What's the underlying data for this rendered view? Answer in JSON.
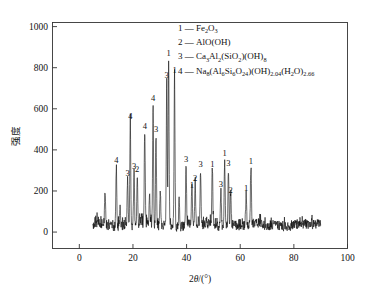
{
  "chart_data": {
    "type": "line",
    "title": "",
    "xlabel": "2θ/(°)",
    "ylabel": "强度",
    "xlim": [
      -10,
      100
    ],
    "ylim": [
      -80,
      1020
    ],
    "xticks": [
      0,
      20,
      40,
      60,
      80,
      100
    ],
    "yticks": [
      0,
      200,
      400,
      600,
      800,
      1000
    ],
    "xtick_labels": [
      "0",
      "20",
      "40",
      "60",
      "80",
      "100"
    ],
    "ytick_labels": [
      "0",
      "200",
      "400",
      "600",
      "800",
      "1000"
    ],
    "grid": false,
    "legend_position": "top-right",
    "series_name": "XRD pattern",
    "x_range_data": [
      5,
      90
    ],
    "baseline": 30,
    "peaks": [
      {
        "two_theta": 9.6,
        "intensity": 205,
        "label": ""
      },
      {
        "two_theta": 13.8,
        "intensity": 320,
        "label": "4"
      },
      {
        "two_theta": 15.2,
        "intensity": 130,
        "label": ""
      },
      {
        "two_theta": 18.0,
        "intensity": 255,
        "label": "3"
      },
      {
        "two_theta": 19.0,
        "intensity": 535,
        "label": "4"
      },
      {
        "two_theta": 20.4,
        "intensity": 290,
        "label": "3"
      },
      {
        "two_theta": 21.6,
        "intensity": 275,
        "label": "2"
      },
      {
        "two_theta": 24.4,
        "intensity": 487,
        "label": "4"
      },
      {
        "two_theta": 26.2,
        "intensity": 180,
        "label": ""
      },
      {
        "two_theta": 27.5,
        "intensity": 620,
        "label": "4"
      },
      {
        "two_theta": 28.6,
        "intensity": 470,
        "label": "3"
      },
      {
        "two_theta": 30.2,
        "intensity": 200,
        "label": ""
      },
      {
        "two_theta": 32.6,
        "intensity": 735,
        "label": "3"
      },
      {
        "two_theta": 33.3,
        "intensity": 840,
        "label": "1"
      },
      {
        "two_theta": 35.5,
        "intensity": 760,
        "label": "1"
      },
      {
        "two_theta": 37.2,
        "intensity": 180,
        "label": ""
      },
      {
        "two_theta": 39.8,
        "intensity": 325,
        "label": "3"
      },
      {
        "two_theta": 42.0,
        "intensity": 200,
        "label": "1"
      },
      {
        "two_theta": 43.2,
        "intensity": 235,
        "label": "2"
      },
      {
        "two_theta": 45.2,
        "intensity": 300,
        "label": "3"
      },
      {
        "two_theta": 49.6,
        "intensity": 300,
        "label": "1"
      },
      {
        "two_theta": 52.8,
        "intensity": 205,
        "label": "3"
      },
      {
        "two_theta": 54.2,
        "intensity": 355,
        "label": "1"
      },
      {
        "two_theta": 55.6,
        "intensity": 305,
        "label": "3"
      },
      {
        "two_theta": 56.4,
        "intensity": 175,
        "label": "2"
      },
      {
        "two_theta": 62.2,
        "intensity": 185,
        "label": "1"
      },
      {
        "two_theta": 64.0,
        "intensity": 315,
        "label": "1"
      }
    ]
  },
  "legend": {
    "entries": [
      {
        "key": "1",
        "dash": "—",
        "formula_plain": "Fe2O3",
        "parts": [
          {
            "t": "Fe",
            "s": 0
          },
          {
            "t": "2",
            "s": 1
          },
          {
            "t": "O",
            "s": 0
          },
          {
            "t": "3",
            "s": 1
          }
        ]
      },
      {
        "key": "2",
        "dash": "—",
        "formula_plain": "AlO(OH)",
        "parts": [
          {
            "t": "AlO(OH)",
            "s": 0
          }
        ]
      },
      {
        "key": "3",
        "dash": "—",
        "formula_plain": "Ca3Al2(SiO2)(OH)8",
        "parts": [
          {
            "t": "Ca",
            "s": 0
          },
          {
            "t": "3",
            "s": 1
          },
          {
            "t": "Al",
            "s": 0
          },
          {
            "t": "2",
            "s": 1
          },
          {
            "t": "(SiO",
            "s": 0
          },
          {
            "t": "2",
            "s": 1
          },
          {
            "t": ")(OH)",
            "s": 0
          },
          {
            "t": "8",
            "s": 1
          }
        ]
      },
      {
        "key": "4",
        "dash": "—",
        "formula_plain": "Na8(Al6Si6O24)(OH)2.04(H2O)2.66",
        "parts": [
          {
            "t": "Na",
            "s": 0
          },
          {
            "t": "8",
            "s": 1
          },
          {
            "t": "(Al",
            "s": 0
          },
          {
            "t": "6",
            "s": 1
          },
          {
            "t": "Si",
            "s": 0
          },
          {
            "t": "6",
            "s": 1
          },
          {
            "t": "O",
            "s": 0
          },
          {
            "t": "24",
            "s": 1
          },
          {
            "t": ")(OH)",
            "s": 0
          },
          {
            "t": "2.04",
            "s": 1
          },
          {
            "t": "(H",
            "s": 0
          },
          {
            "t": "2",
            "s": 1
          },
          {
            "t": "O)",
            "s": 0
          },
          {
            "t": "2.66",
            "s": 1
          }
        ]
      }
    ]
  },
  "axes": {
    "y_title": "强度",
    "x_title_pre": "2",
    "x_title_theta": "θ",
    "x_title_post": "/(°)"
  },
  "colors": {
    "line": "#111111",
    "axis": "#333333",
    "background": "#ffffff",
    "text": "#111111"
  }
}
